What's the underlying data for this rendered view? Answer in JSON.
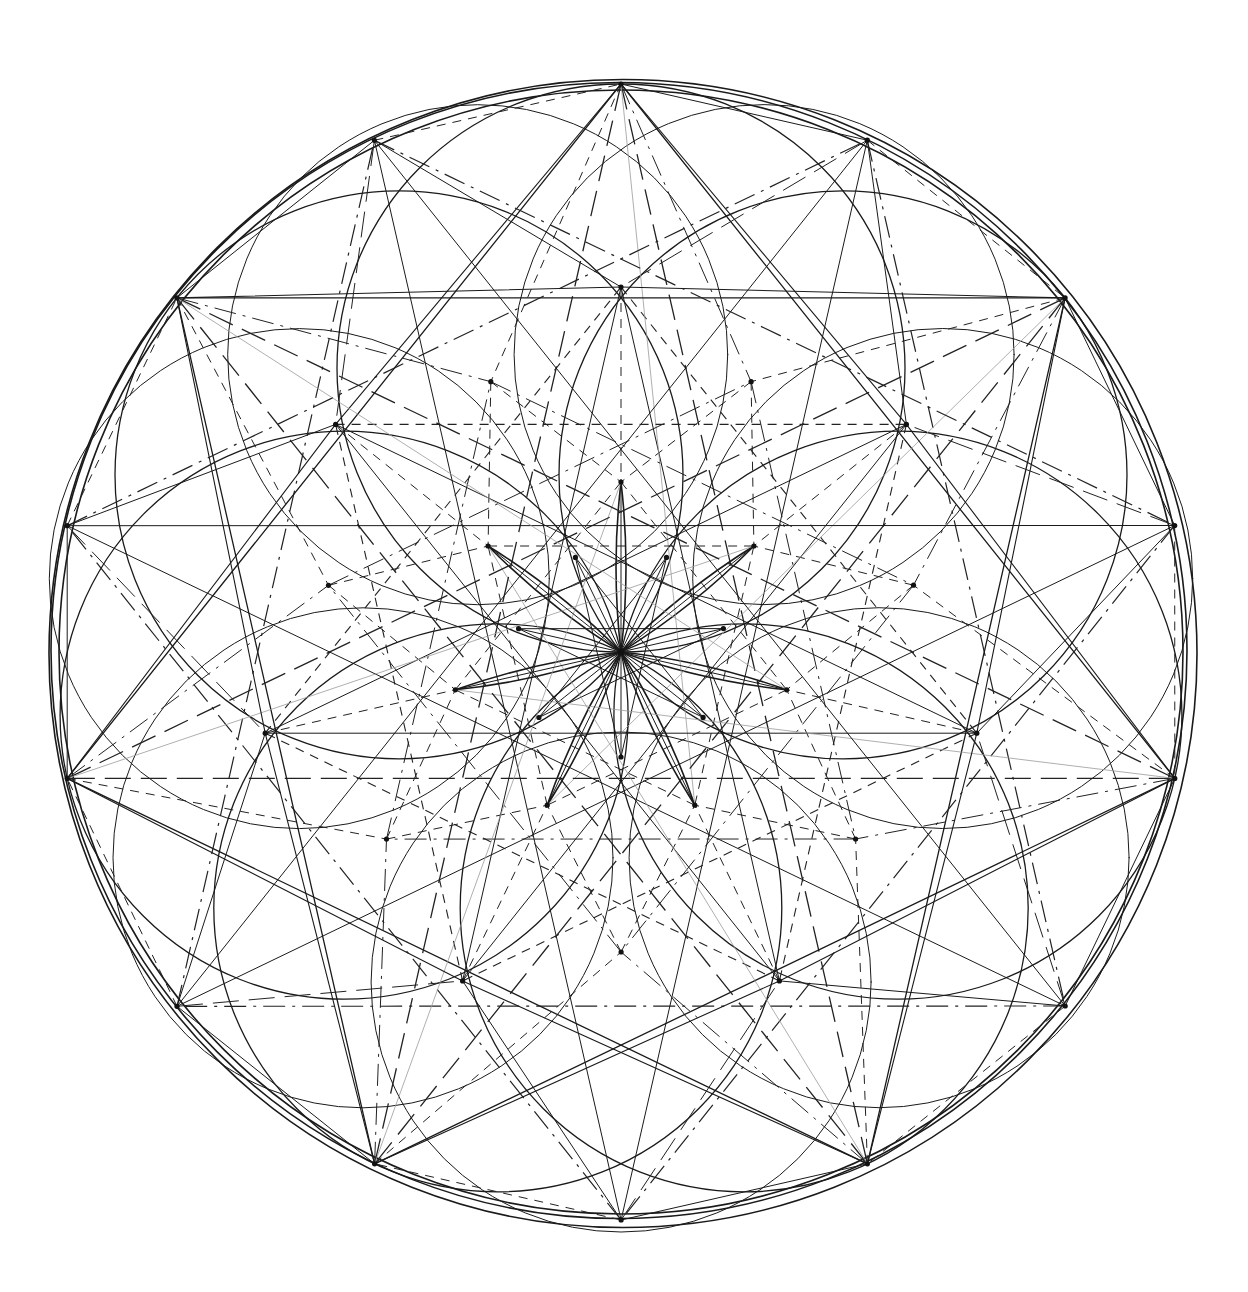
{
  "figure": {
    "title": "",
    "center": [
      621,
      652
    ],
    "outer_radius": 568,
    "symmetry": 7,
    "rotation_deg": -90,
    "colors": {
      "ink": "#1a1a1a",
      "faint": "#9a9a9a",
      "background": "#ffffff"
    }
  },
  "layers": {
    "outer_ring_radii": [
      568,
      562,
      574
    ],
    "petal_circle_radius": 284,
    "petal_circle_offset": 284,
    "mid_circle_radius": 250,
    "mid_circle_offset": 330,
    "vertex_rings": [
      {
        "name": "outer",
        "radius": 568,
        "offset_deg": 0
      },
      {
        "name": "outer-b",
        "radius": 568,
        "offset_deg": 25.7
      },
      {
        "name": "mid",
        "radius": 365,
        "offset_deg": 0
      },
      {
        "name": "mid-b",
        "radius": 300,
        "offset_deg": 25.7
      },
      {
        "name": "inner",
        "radius": 170,
        "offset_deg": 0
      },
      {
        "name": "core",
        "radius": 105,
        "offset_deg": 25.7
      }
    ]
  }
}
